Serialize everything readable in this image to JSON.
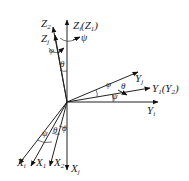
{
  "diagram": {
    "origin": {
      "x": 67,
      "y": 102
    },
    "axes": {
      "Zi": {
        "label": "Z",
        "sub": "i",
        "suffix": "(Z",
        "suffix_sub": "1",
        "suffix_end": ")"
      },
      "Z2": {
        "label": "Z",
        "sub": "2"
      },
      "Zj": {
        "label": "Z",
        "sub": "j"
      },
      "Yj": {
        "label": "Y",
        "sub": "j"
      },
      "Y1": {
        "label": "Y",
        "sub": "1",
        "suffix": "(Y",
        "suffix_sub": "2",
        "suffix_end": ")"
      },
      "Yi": {
        "label": "Y",
        "sub": "i"
      },
      "Xi": {
        "label": "X",
        "sub": "i"
      },
      "X1": {
        "label": "X",
        "sub": "1"
      },
      "X2": {
        "label": "X",
        "sub": "2"
      },
      "Xj": {
        "label": "X",
        "sub": "j"
      }
    },
    "angles": {
      "phi_top": "φ",
      "psi_top": "ψ",
      "theta_top": "θ",
      "phi_y": "φ",
      "theta_y": "θ",
      "psi_y": "ψ",
      "psi_x": "ψ",
      "theta_x": "θ",
      "phi_x": "ϕ"
    }
  }
}
